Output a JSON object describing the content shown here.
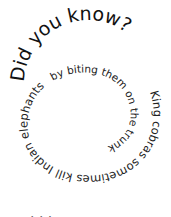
{
  "spiral": {
    "headline": "Did you know?",
    "fact_part1": "King cobras sometimes kill Indian elephants",
    "fact_part2": "by biting them on the trunk"
  },
  "bottom_partial_text": "· · ·"
}
